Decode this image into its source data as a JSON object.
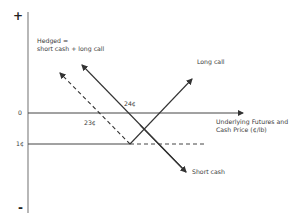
{
  "diagram": {
    "title_line1": "Hedged =",
    "title_line2": "short cash + long call",
    "y_axis": {
      "plus_label": "+",
      "minus_label": "-"
    },
    "y_ticks": [
      {
        "label": "0"
      },
      {
        "label": "1¢"
      }
    ],
    "x_axis_label_line1": "Underlying Futures and",
    "x_axis_label_line2": "Cash Price (¢/lb)",
    "lines": {
      "long_call": {
        "label": "Long call",
        "style": "solid"
      },
      "short_cash": {
        "label": "Short cash",
        "style": "solid"
      },
      "hedged": {
        "label": "Hedged",
        "style": "dashed"
      }
    },
    "annotations": [
      {
        "label": "24¢"
      },
      {
        "label": "23¢"
      }
    ],
    "colors": {
      "line": "#333333",
      "axis": "#777777",
      "background": "#ffffff"
    }
  }
}
